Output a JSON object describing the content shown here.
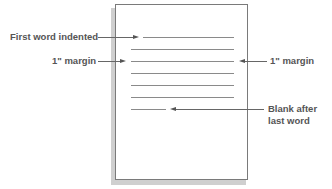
{
  "diagram": {
    "title": "",
    "labels": {
      "first_word_indented": "First word indented",
      "left_margin": "1\" margin",
      "right_margin": "1\" margin",
      "blank_after_line1": "Blank after",
      "blank_after_line2": "last word"
    },
    "page": {
      "text_lines": [
        {
          "type": "indented-first-line"
        },
        {
          "type": "full-line"
        },
        {
          "type": "full-line"
        },
        {
          "type": "full-line"
        },
        {
          "type": "full-line"
        },
        {
          "type": "full-line"
        },
        {
          "type": "short-last-line"
        }
      ]
    },
    "colors": {
      "page_border": "#7a7a7a",
      "page_shadow": "#cfcfcf",
      "lines": "#8a8a8a",
      "label_text": "#555555"
    }
  }
}
